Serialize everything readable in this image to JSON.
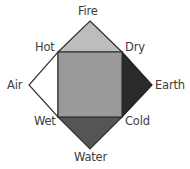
{
  "diagram": {
    "elements": [
      {
        "id": "fire",
        "label": "Fire",
        "color": "#bdbdbd"
      },
      {
        "id": "air",
        "label": "Air",
        "color": "#ffffff"
      },
      {
        "id": "earth",
        "label": "Earth",
        "color": "#2a2a2a"
      },
      {
        "id": "water",
        "label": "Water",
        "color": "#555555"
      }
    ],
    "qualities": [
      {
        "id": "hot",
        "label": "Hot"
      },
      {
        "id": "dry",
        "label": "Dry"
      },
      {
        "id": "wet",
        "label": "Wet"
      },
      {
        "id": "cold",
        "label": "Cold"
      }
    ],
    "center_square_color": "#9a9a9a",
    "stroke_color": "#333333"
  }
}
